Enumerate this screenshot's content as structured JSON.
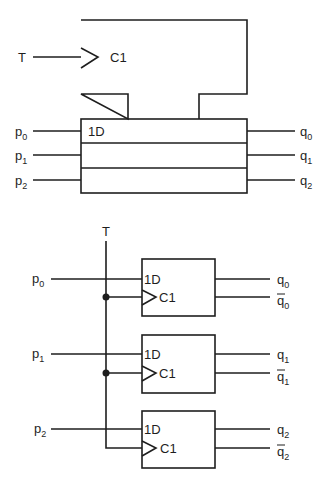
{
  "diagram": {
    "colors": {
      "line": "#1e1e1e",
      "background": "#ffffff"
    },
    "top": {
      "clock_label": "T",
      "control_block_label": "C1",
      "data_label": "1D",
      "inputs": [
        {
          "base": "p",
          "sub": "0"
        },
        {
          "base": "p",
          "sub": "1"
        },
        {
          "base": "p",
          "sub": "2"
        }
      ],
      "outputs": [
        {
          "base": "q",
          "sub": "0"
        },
        {
          "base": "q",
          "sub": "1"
        },
        {
          "base": "q",
          "sub": "2"
        }
      ]
    },
    "bottom": {
      "clock_label": "T",
      "flipflops": [
        {
          "d_label": "1D",
          "c_label": "C1",
          "input": {
            "base": "p",
            "sub": "0"
          },
          "q": {
            "base": "q",
            "sub": "0"
          },
          "qbar": {
            "base": "q",
            "sub": "0"
          }
        },
        {
          "d_label": "1D",
          "c_label": "C1",
          "input": {
            "base": "p",
            "sub": "1"
          },
          "q": {
            "base": "q",
            "sub": "1"
          },
          "qbar": {
            "base": "q",
            "sub": "1"
          }
        },
        {
          "d_label": "1D",
          "c_label": "C1",
          "input": {
            "base": "p",
            "sub": "2"
          },
          "q": {
            "base": "q",
            "sub": "2"
          },
          "qbar": {
            "base": "q",
            "sub": "2"
          }
        }
      ]
    }
  }
}
